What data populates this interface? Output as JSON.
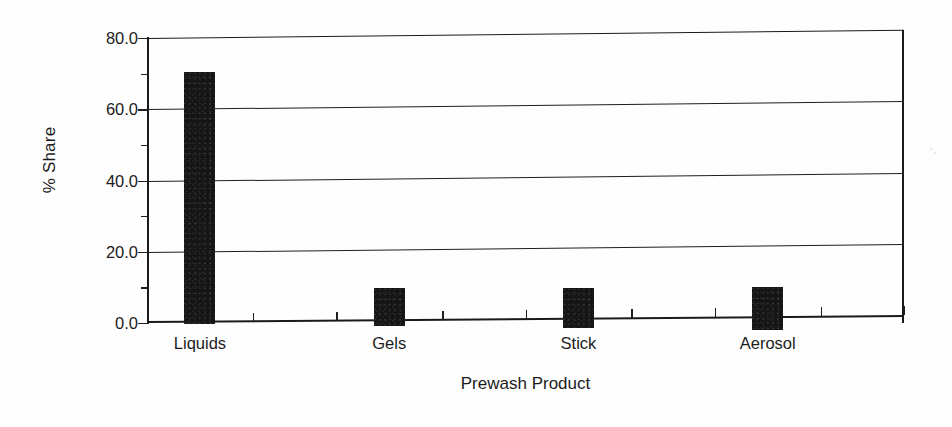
{
  "chart_data": {
    "type": "bar",
    "title": "",
    "xlabel": "Prewash Product",
    "ylabel": "% Share",
    "categories": [
      "Liquids",
      "Gels",
      "Stick",
      "Aerosol"
    ],
    "values": [
      70.7,
      10.4,
      11.0,
      11.8
    ],
    "ylim": [
      0.0,
      80.0
    ],
    "ytick_labels": [
      "0.0",
      "20.0",
      "40.0",
      "60.0",
      "80.0"
    ],
    "ytick_values": [
      0.0,
      20.0,
      40.0,
      60.0,
      80.0
    ],
    "yminor_tick_values": [
      10.0,
      30.0,
      50.0,
      70.0
    ],
    "grid": "horizontal",
    "legend": "none",
    "bar_color": "#151515",
    "axis_color": "#1a1a1a",
    "background_color": "#fefefe"
  }
}
